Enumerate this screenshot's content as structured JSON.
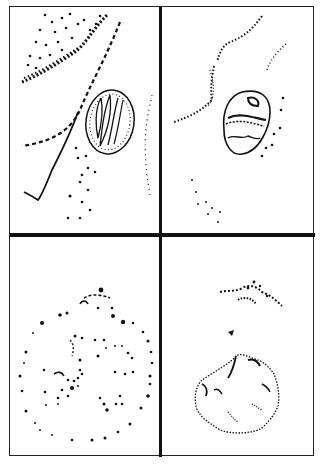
{
  "figure": {
    "layout": "2x2 grid",
    "colors": {
      "background": "#ffffff",
      "ink": "#111111"
    },
    "panels": [
      {
        "position": "top-left",
        "subject": "oval-egg-with-coiled-larva",
        "features": [
          "stippled tissue band",
          "dashed curved lines",
          "oval shell with internal folded structure"
        ]
      },
      {
        "position": "top-right",
        "subject": "segmented-oval-egg",
        "features": [
          "dotted streaks",
          "barrel-shaped egg with bands",
          "scattered dots"
        ]
      },
      {
        "position": "bottom-left",
        "subject": "dotted-circular-outline",
        "features": [
          "scattered dots forming loose circle"
        ]
      },
      {
        "position": "bottom-right",
        "subject": "irregular-polygonal-mass",
        "features": [
          "small dotted cluster",
          "single dark speck",
          "stippled polygon outline"
        ]
      }
    ]
  }
}
